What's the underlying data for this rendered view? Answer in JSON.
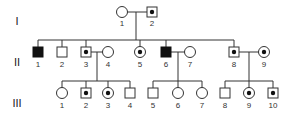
{
  "generations": [
    {
      "roman": "I",
      "y": 12,
      "label_y": 26,
      "roman_y": 25
    },
    {
      "roman": "II",
      "y": 52,
      "label_y": 67,
      "roman_y": 66
    },
    {
      "roman": "III",
      "y": 93,
      "label_y": 108,
      "roman_y": 107
    }
  ],
  "individuals": [
    {
      "id": "I-1",
      "num": "1",
      "gen": 0,
      "x": 122,
      "sex": "female",
      "status": "unaffected"
    },
    {
      "id": "I-2",
      "num": "2",
      "gen": 0,
      "x": 152,
      "sex": "male",
      "status": "carrier"
    },
    {
      "id": "II-1",
      "num": "1",
      "gen": 1,
      "x": 38,
      "sex": "male",
      "status": "affected"
    },
    {
      "id": "II-2",
      "num": "2",
      "gen": 1,
      "x": 62,
      "sex": "male",
      "status": "unaffected"
    },
    {
      "id": "II-3",
      "num": "3",
      "gen": 1,
      "x": 86,
      "sex": "male",
      "status": "carrier"
    },
    {
      "id": "II-4",
      "num": "4",
      "gen": 1,
      "x": 108,
      "sex": "female",
      "status": "unaffected"
    },
    {
      "id": "II-5",
      "num": "5",
      "gen": 1,
      "x": 140,
      "sex": "female",
      "status": "carrier"
    },
    {
      "id": "II-6",
      "num": "6",
      "gen": 1,
      "x": 166,
      "sex": "male",
      "status": "affected"
    },
    {
      "id": "II-7",
      "num": "7",
      "gen": 1,
      "x": 190,
      "sex": "female",
      "status": "unaffected"
    },
    {
      "id": "II-8",
      "num": "8",
      "gen": 1,
      "x": 234,
      "sex": "male",
      "status": "carrier"
    },
    {
      "id": "II-9",
      "num": "9",
      "gen": 1,
      "x": 264,
      "sex": "female",
      "status": "carrier"
    },
    {
      "id": "III-1",
      "num": "1",
      "gen": 2,
      "x": 62,
      "sex": "female",
      "status": "unaffected"
    },
    {
      "id": "III-2",
      "num": "2",
      "gen": 2,
      "x": 86,
      "sex": "male",
      "status": "carrier"
    },
    {
      "id": "III-3",
      "num": "3",
      "gen": 2,
      "x": 108,
      "sex": "female",
      "status": "carrier"
    },
    {
      "id": "III-4",
      "num": "4",
      "gen": 2,
      "x": 130,
      "sex": "male",
      "status": "unaffected"
    },
    {
      "id": "III-5",
      "num": "5",
      "gen": 2,
      "x": 153,
      "sex": "male",
      "status": "unaffected"
    },
    {
      "id": "III-6",
      "num": "6",
      "gen": 2,
      "x": 178,
      "sex": "female",
      "status": "unaffected"
    },
    {
      "id": "III-7",
      "num": "7",
      "gen": 2,
      "x": 202,
      "sex": "female",
      "status": "unaffected"
    },
    {
      "id": "III-8",
      "num": "8",
      "gen": 2,
      "x": 225,
      "sex": "male",
      "status": "unaffected"
    },
    {
      "id": "III-9",
      "num": "9",
      "gen": 2,
      "x": 249,
      "sex": "female",
      "status": "carrier"
    },
    {
      "id": "III-10",
      "num": "10",
      "gen": 2,
      "x": 273,
      "sex": "male",
      "status": "carrier"
    }
  ],
  "couples": [
    {
      "a": "I-1",
      "b": "I-2",
      "children": [
        "II-1",
        "II-2",
        "II-3",
        "II-5",
        "II-6",
        "II-8"
      ]
    },
    {
      "a": "II-3",
      "b": "II-4",
      "children": [
        "III-1",
        "III-2",
        "III-3",
        "III-4"
      ]
    },
    {
      "a": "II-6",
      "b": "II-7",
      "children": [
        "III-5",
        "III-6",
        "III-7"
      ]
    },
    {
      "a": "II-8",
      "b": "II-9",
      "children": [
        "III-8",
        "III-9",
        "III-10"
      ]
    }
  ],
  "legend_symbols": {
    "affected": "filled",
    "carrier": "dot-center",
    "unaffected": "open"
  }
}
